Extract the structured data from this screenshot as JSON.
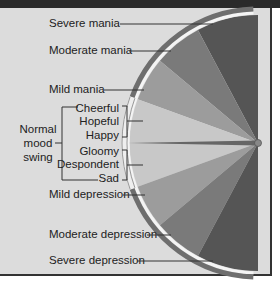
{
  "diagram": {
    "center_label": "",
    "mania_levels": [
      {
        "id": "severe-mania",
        "label": "Severe mania"
      },
      {
        "id": "moderate-mania",
        "label": "Moderate mania"
      },
      {
        "id": "mild-mania",
        "label": "Mild mania"
      }
    ],
    "normal": {
      "label_lines": [
        "Normal",
        "mood",
        "swing"
      ],
      "upper_moods": [
        "Cheerful",
        "Hopeful",
        "Happy"
      ],
      "lower_moods": [
        "Gloomy",
        "Despondent",
        "Sad"
      ]
    },
    "depression_levels": [
      {
        "id": "mild-depression",
        "label": "Mild depression"
      },
      {
        "id": "moderate-depression",
        "label": "Moderate depression"
      },
      {
        "id": "severe-depression",
        "label": "Severe depression"
      }
    ],
    "colors": {
      "background": "#dcdcdc",
      "frame_top": "#2a2a2a",
      "severe": "#555555",
      "moderate": "#7a7a7a",
      "mild": "#9c9c9c",
      "normal": "#c8c8c8",
      "needle": "#666666",
      "outer_band": "#6e6e6e",
      "band_gap": "#f4f4f4"
    }
  }
}
